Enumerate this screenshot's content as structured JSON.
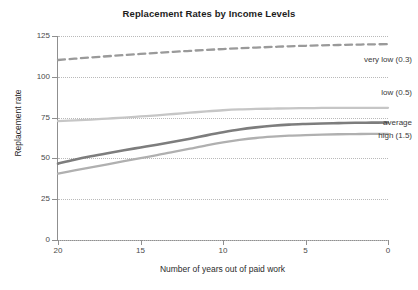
{
  "chart_data": {
    "type": "line",
    "title": "Replacement Rates by Income Levels",
    "xlabel": "Number of years out of paid work",
    "ylabel": "Replacement rate",
    "xlim": [
      20,
      0
    ],
    "ylim": [
      0,
      125
    ],
    "x_reversed": true,
    "grid": true,
    "legend_position": "right-inline",
    "xticks": [
      "20",
      "15",
      "10",
      "5",
      "0"
    ],
    "xtick_values": [
      20,
      15,
      10,
      5,
      0
    ],
    "yticks": [
      "0",
      "25",
      "50",
      "75",
      "100",
      "125"
    ],
    "ytick_values": [
      0,
      25,
      50,
      75,
      100,
      125
    ],
    "x": [
      20,
      19,
      18,
      17,
      16,
      15,
      14,
      13,
      12,
      11,
      10,
      9,
      8,
      7,
      6,
      5,
      4,
      3,
      2,
      1,
      0
    ],
    "series": [
      {
        "name": "very low (0.3)",
        "label": "very low (0.3)",
        "color": "#9a9a9a",
        "style": "dashed",
        "width": 2.3,
        "values": [
          110.3,
          111.1,
          111.9,
          112.6,
          113.3,
          114.0,
          114.7,
          115.3,
          115.9,
          116.5,
          117.0,
          117.5,
          117.9,
          118.3,
          118.7,
          119.0,
          119.3,
          119.5,
          119.7,
          119.9,
          120.0
        ]
      },
      {
        "name": "low (0.5)",
        "label": "low (0.5)",
        "color": "#c6c6c6",
        "style": "solid",
        "width": 2.3,
        "values": [
          72.8,
          73.3,
          73.8,
          74.4,
          75.0,
          75.7,
          76.4,
          77.2,
          78.0,
          78.8,
          79.5,
          80.0,
          80.3,
          80.5,
          80.7,
          80.8,
          80.9,
          81.0,
          81.0,
          81.0,
          81.0
        ]
      },
      {
        "name": "average",
        "label": "average",
        "color": "#7d7d7d",
        "style": "solid",
        "width": 2.6,
        "values": [
          46.8,
          49.2,
          51.3,
          53.2,
          55.0,
          56.7,
          58.4,
          60.2,
          62.1,
          64.1,
          66.0,
          67.7,
          69.0,
          70.0,
          70.7,
          71.1,
          71.4,
          71.6,
          71.8,
          71.9,
          72.0
        ]
      },
      {
        "name": "high (1.5)",
        "label": "high (1.5)",
        "color": "#b0b0b0",
        "style": "solid",
        "width": 2.3,
        "values": [
          40.7,
          42.6,
          44.5,
          46.4,
          48.3,
          50.2,
          52.0,
          54.0,
          56.0,
          58.0,
          59.8,
          61.3,
          62.5,
          63.3,
          63.9,
          64.3,
          64.6,
          64.8,
          64.9,
          65.0,
          65.0
        ]
      }
    ],
    "series_label_positions": [
      {
        "name": "very low (0.3)",
        "top": 55,
        "right": 6
      },
      {
        "name": "low (0.5)",
        "top": 88,
        "right": 6
      },
      {
        "name": "average",
        "top": 118,
        "right": 6
      },
      {
        "name": "high (1.5)",
        "top": 131,
        "right": 6
      }
    ]
  },
  "colors": {
    "axis": "#8f8f8f",
    "grid": "#b9b9b9",
    "text": "#2b2b2b",
    "title": "#1d1d1d",
    "background": "#ffffff"
  }
}
